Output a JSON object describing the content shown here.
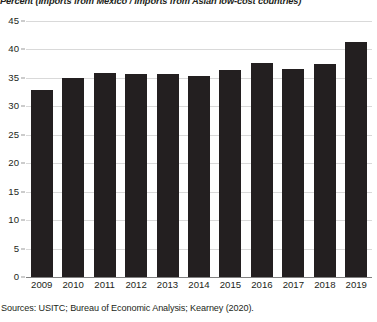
{
  "chart_data": {
    "type": "bar",
    "title": "Percent (Imports from Mexico / Imports from Asian low-cost countries)",
    "xlabel": "",
    "ylabel": "",
    "ylim": [
      0,
      45
    ],
    "ytick_step": 5,
    "yticks": [
      "0",
      "5",
      "10",
      "15",
      "20",
      "25",
      "30",
      "35",
      "40",
      "45"
    ],
    "categories": [
      "2009",
      "2010",
      "2011",
      "2012",
      "2013",
      "2014",
      "2015",
      "2016",
      "2017",
      "2018",
      "2019"
    ],
    "values": [
      32.8,
      35.0,
      35.8,
      35.7,
      35.6,
      35.4,
      36.4,
      37.7,
      36.5,
      37.5,
      41.3
    ],
    "grid": true,
    "legend": false,
    "bar_color": "#231f20",
    "gridline_color": "#d9d9d9",
    "axis_color": "#808080"
  },
  "source": {
    "note": "Sources: USITC; Bureau of Economic Analysis; Kearney (2020)."
  }
}
